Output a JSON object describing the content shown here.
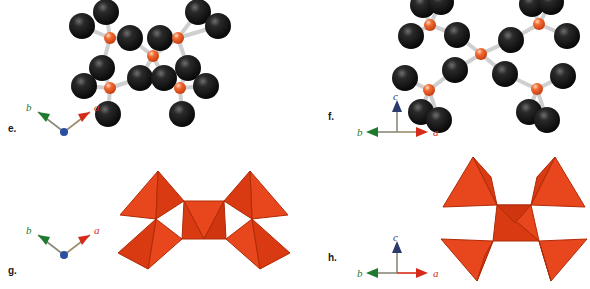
{
  "figure": {
    "type": "crystal-structure-figure",
    "background": "#ffffff",
    "panel_count": 4,
    "layout": "2x2 grid"
  },
  "colors": {
    "anion_sphere": "#0b0b0b",
    "anion_highlight": "#ffffff",
    "cation_sphere": "#e8501f",
    "cation_highlight": "#ffd0b5",
    "bond": "#c9c9c9",
    "tetra_face_light": "#e8461c",
    "tetra_face_mid": "#d93a12",
    "tetra_face_dark": "#c6330c",
    "tetra_edge": "#b02b08",
    "axis_a": "#d62b1a",
    "axis_b": "#1e7a2e",
    "axis_c": "#2b3a6b",
    "axis_origin": "#2b4fa0",
    "axis_line": "#8a8a7a",
    "label_text": "#1a1a1a"
  },
  "panels": [
    {
      "id": "e",
      "label": "e.",
      "representation": "ball-and-stick",
      "axes": {
        "style": "projected-2d",
        "origin_dot": true,
        "arrows": [
          {
            "name": "a",
            "label": "a",
            "color": "#d62b1a",
            "direction": "up-right"
          },
          {
            "name": "b",
            "label": "b",
            "color": "#1e7a2e",
            "direction": "up-left"
          }
        ],
        "c_axis": "out-of-plane (origin dot)"
      },
      "atoms": {
        "cation_count": 5,
        "anion_count": 16,
        "cation_color": "#e8501f",
        "anion_color": "#0b0b0b"
      }
    },
    {
      "id": "f",
      "label": "f.",
      "representation": "ball-and-stick",
      "axes": {
        "style": "orthogonal-3d",
        "origin_dot": false,
        "arrows": [
          {
            "name": "c",
            "label": "c",
            "color": "#2b3a6b",
            "direction": "up"
          },
          {
            "name": "b",
            "label": "b",
            "color": "#1e7a2e",
            "direction": "left"
          },
          {
            "name": "a",
            "label": "a",
            "color": "#d62b1a",
            "direction": "right"
          }
        ]
      },
      "atoms": {
        "cation_count": 5,
        "anion_count": 16,
        "cation_color": "#e8501f",
        "anion_color": "#0b0b0b"
      }
    },
    {
      "id": "g",
      "label": "g.",
      "representation": "polyhedral-tetrahedra",
      "axes": {
        "style": "projected-2d",
        "origin_dot": true,
        "arrows": [
          {
            "name": "a",
            "label": "a",
            "color": "#d62b1a",
            "direction": "up-right"
          },
          {
            "name": "b",
            "label": "b",
            "color": "#1e7a2e",
            "direction": "up-left"
          }
        ],
        "c_axis": "out-of-plane (origin dot)"
      },
      "polyhedra": {
        "count": 5,
        "shape": "tetrahedron",
        "connectivity": "corner-sharing",
        "color": "#e8461c"
      }
    },
    {
      "id": "h",
      "label": "h.",
      "representation": "polyhedral-tetrahedra",
      "axes": {
        "style": "orthogonal-3d",
        "origin_dot": false,
        "arrows": [
          {
            "name": "c",
            "label": "c",
            "color": "#2b3a6b",
            "direction": "up"
          },
          {
            "name": "b",
            "label": "b",
            "color": "#1e7a2e",
            "direction": "left"
          },
          {
            "name": "a",
            "label": "a",
            "color": "#d62b1a",
            "direction": "right"
          }
        ]
      },
      "polyhedra": {
        "count": 5,
        "shape": "tetrahedron",
        "connectivity": "corner-sharing",
        "color": "#e8461c"
      }
    }
  ],
  "axis_labels": {
    "a": "a",
    "b": "b",
    "c": "c"
  }
}
